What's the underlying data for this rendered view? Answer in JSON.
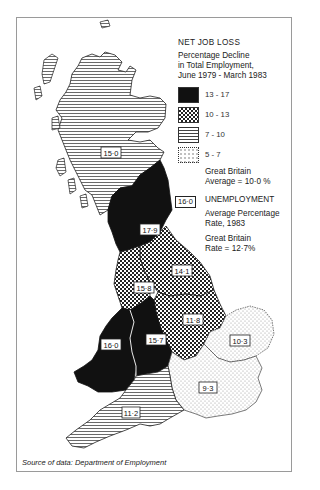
{
  "legend": {
    "title": "NET JOB LOSS",
    "subtitle_line1": "Percentage Decline",
    "subtitle_line2": "in Total Employment,",
    "subtitle_line3": "June 1979 - March 1983",
    "categories": [
      {
        "range": "13 - 17",
        "pattern": "solid-black"
      },
      {
        "range": "10 - 13",
        "pattern": "checkered"
      },
      {
        "range": "7 - 10",
        "pattern": "horizontal-lines"
      },
      {
        "range": "5 - 7",
        "pattern": "dotted"
      }
    ],
    "gb_average_line1": "Great Britain",
    "gb_average_line2": "Average = 10·0 %",
    "unemployment_title": "UNEMPLOYMENT",
    "unemployment_example_box": "16·0",
    "unemployment_desc_line1": "Average Percentage",
    "unemployment_desc_line2": "Rate, 1983",
    "gb_rate_line1": "Great Britain",
    "gb_rate_line2": "Rate = 12·7%"
  },
  "regions": [
    {
      "name": "Scotland",
      "unemployment": "15·0",
      "job_loss_band": "7 - 10"
    },
    {
      "name": "North",
      "unemployment": "17·9",
      "job_loss_band": "13 - 17"
    },
    {
      "name": "Yorkshire and Humberside",
      "unemployment": "14·1",
      "job_loss_band": "10 - 13"
    },
    {
      "name": "North West",
      "unemployment": "15·8",
      "job_loss_band": "10 - 13"
    },
    {
      "name": "East Midlands",
      "unemployment": "11·8",
      "job_loss_band": "10 - 13"
    },
    {
      "name": "Wales",
      "unemployment": "16·0",
      "job_loss_band": "13 - 17"
    },
    {
      "name": "West Midlands",
      "unemployment": "15·7",
      "job_loss_band": "13 - 17"
    },
    {
      "name": "East Anglia",
      "unemployment": "10·3",
      "job_loss_band": "5 - 7"
    },
    {
      "name": "South East",
      "unemployment": "9·3",
      "job_loss_band": "5 - 7"
    },
    {
      "name": "South West",
      "unemployment": "11·2",
      "job_loss_band": "7 - 10"
    }
  ],
  "source": "Source of data: Department of Employment"
}
